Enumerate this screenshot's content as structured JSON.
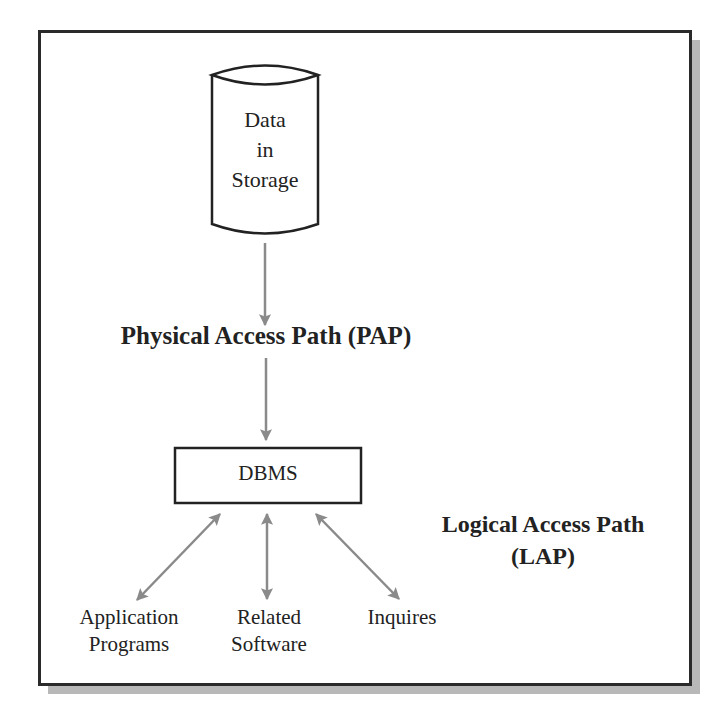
{
  "diagram": {
    "storage": {
      "lines": [
        "Data",
        "in",
        "Storage"
      ],
      "icon": "database-cylinder-icon"
    },
    "physical_path": {
      "label": "Physical Access Path (PAP)"
    },
    "dbms": {
      "label": "DBMS"
    },
    "logical_path": {
      "lines": [
        "Logical Access Path",
        "(LAP)"
      ]
    },
    "clients": [
      {
        "lines": [
          "Application",
          "Programs"
        ],
        "arrow": "bidirectional"
      },
      {
        "lines": [
          "Related",
          "Software"
        ],
        "arrow": "bidirectional"
      },
      {
        "lines": [
          "Inquires"
        ],
        "arrow": "bidirectional"
      }
    ],
    "colors": {
      "frame_border": "#2a2a2a",
      "frame_shadow": "#b8b8b8",
      "arrow": "#8a8a8a",
      "text": "#222222"
    }
  }
}
